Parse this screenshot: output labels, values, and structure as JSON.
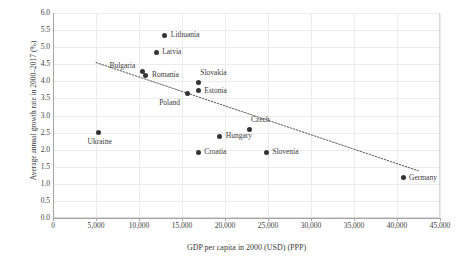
{
  "chart_data": {
    "type": "scatter",
    "title": "",
    "xlabel": "GDP per capita in 2000 (USD) (PPP)",
    "ylabel": "Average annual growth rate in 2000–2017 (%)",
    "xlim": [
      0,
      45000
    ],
    "ylim": [
      0.0,
      6.0
    ],
    "xticks": [
      0,
      5000,
      10000,
      15000,
      20000,
      25000,
      30000,
      35000,
      40000,
      45000
    ],
    "xtick_labels": [
      "0",
      "5,000",
      "10,000",
      "15,000",
      "20,000",
      "25,000",
      "30,000",
      "35,000",
      "40,000",
      "45,000"
    ],
    "yticks": [
      0.0,
      0.5,
      1.0,
      1.5,
      2.0,
      2.5,
      3.0,
      3.5,
      4.0,
      4.5,
      5.0,
      5.5,
      6.0
    ],
    "ytick_labels": [
      "0.0",
      "0.5",
      "1.0",
      "1.5",
      "2.0",
      "2.5",
      "3.0",
      "3.5",
      "4.0",
      "4.5",
      "5.0",
      "5.5",
      "6.0"
    ],
    "grid": true,
    "legend": false,
    "marker_color": "#333333",
    "trendline": {
      "style": "dotted",
      "color": "#595959",
      "x_start": 5000,
      "y_start": 4.55,
      "x_end": 42500,
      "y_end": 1.38
    },
    "points": [
      {
        "label": "Lithuania",
        "x": 13000,
        "y": 5.35,
        "label_pos": "right"
      },
      {
        "label": "Latvia",
        "x": 12000,
        "y": 4.85,
        "label_pos": "right"
      },
      {
        "label": "Bulgaria",
        "x": 10400,
        "y": 4.28,
        "label_pos": "left-above"
      },
      {
        "label": "Romania",
        "x": 10800,
        "y": 4.18,
        "label_pos": "right"
      },
      {
        "label": "Slovakia",
        "x": 16900,
        "y": 3.97,
        "label_pos": "right-above"
      },
      {
        "label": "Estonia",
        "x": 16900,
        "y": 3.73,
        "label_pos": "right"
      },
      {
        "label": "Poland",
        "x": 15600,
        "y": 3.65,
        "label_pos": "left-below"
      },
      {
        "label": "Czech",
        "x": 22800,
        "y": 2.6,
        "label_pos": "right-above"
      },
      {
        "label": "Ukraine",
        "x": 5300,
        "y": 2.5,
        "label_pos": "below"
      },
      {
        "label": "Hungary",
        "x": 19400,
        "y": 2.4,
        "label_pos": "right"
      },
      {
        "label": "Croatia",
        "x": 16900,
        "y": 1.93,
        "label_pos": "right"
      },
      {
        "label": "Slovenia",
        "x": 24800,
        "y": 1.93,
        "label_pos": "right"
      },
      {
        "label": "Germany",
        "x": 40700,
        "y": 1.18,
        "label_pos": "right"
      }
    ]
  }
}
